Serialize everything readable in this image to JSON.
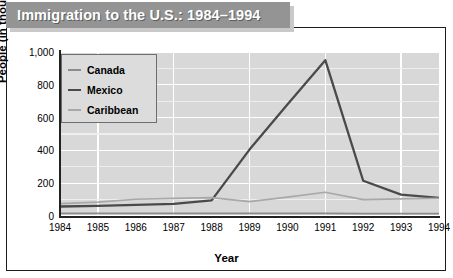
{
  "title": "Immigration to the U.S.: 1984–1994",
  "axis": {
    "ylabel": "People (in thousands)",
    "xlabel": "Year"
  },
  "legend": {
    "items": [
      {
        "label": "Canada",
        "color": "#8c8c8c"
      },
      {
        "label": "Mexico",
        "color": "#4a4a4a"
      },
      {
        "label": "Caribbean",
        "color": "#a8a8a8"
      }
    ]
  },
  "colors": {
    "plot_background": "#d8d8d8",
    "gridline": "#ffffff",
    "frame": "#1c1c1c",
    "banner": "#949494",
    "banner_text": "#ffffff",
    "banner_shadow": "#c9c9c9"
  },
  "chart_data": {
    "type": "line",
    "title": "Immigration to the U.S.: 1984–1994",
    "xlabel": "Year",
    "ylabel": "People (in thousands)",
    "categories": [
      "1984",
      "1985",
      "1986",
      "1987",
      "1988",
      "1989",
      "1990",
      "1991",
      "1992",
      "1993",
      "1994"
    ],
    "x": [
      1984,
      1985,
      1986,
      1987,
      1988,
      1989,
      1990,
      1991,
      1992,
      1993,
      1994
    ],
    "xlim": [
      1984,
      1994
    ],
    "ylim": [
      0,
      1000
    ],
    "yticks": [
      0,
      200,
      400,
      600,
      800,
      1000
    ],
    "ytick_labels": [
      "0",
      "200",
      "400",
      "600",
      "800",
      "1,000"
    ],
    "grid": true,
    "legend_position": "upper-left-inside",
    "series": [
      {
        "name": "Canada",
        "color": "#8c8c8c",
        "values": [
          16,
          16,
          16,
          16,
          16,
          16,
          16,
          16,
          15,
          15,
          15
        ]
      },
      {
        "name": "Mexico",
        "color": "#4a4a4a",
        "values": [
          58,
          62,
          68,
          74,
          95,
          405,
          680,
          950,
          215,
          130,
          110
        ]
      },
      {
        "name": "Caribbean",
        "color": "#a8a8a8",
        "values": [
          75,
          85,
          102,
          108,
          112,
          88,
          115,
          145,
          100,
          105,
          108
        ]
      }
    ]
  }
}
